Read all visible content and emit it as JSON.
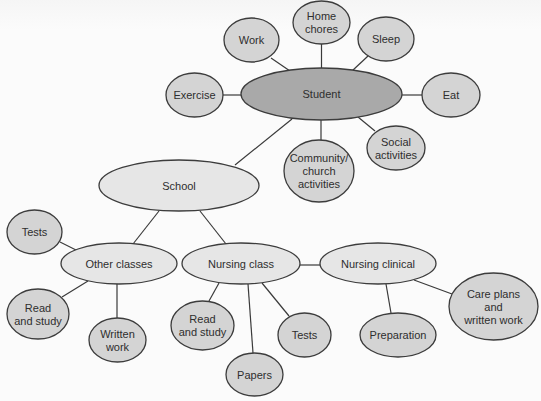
{
  "diagram": {
    "colors": {
      "root_fill": "#a9a9a9",
      "hub_fill": "#e6e6e6",
      "leaf_fill": "#d4d4d4",
      "stroke": "#3c3c3c",
      "text": "#2e2e2e"
    },
    "nodes": [
      {
        "id": "student",
        "lines": [
          "Student"
        ],
        "cx": 321.5,
        "cy": 94,
        "rx": 80.5,
        "ry": 26,
        "kind": "root"
      },
      {
        "id": "work",
        "lines": [
          "Work"
        ],
        "cx": 251.5,
        "cy": 40,
        "rx": 27.5,
        "ry": 22,
        "kind": "leaf"
      },
      {
        "id": "home-chores",
        "lines": [
          "Home",
          "chores"
        ],
        "cx": 321.5,
        "cy": 22.5,
        "rx": 28.5,
        "ry": 21.5,
        "kind": "leaf"
      },
      {
        "id": "sleep",
        "lines": [
          "Sleep"
        ],
        "cx": 386,
        "cy": 39,
        "rx": 28,
        "ry": 22,
        "kind": "leaf"
      },
      {
        "id": "exercise",
        "lines": [
          "Exercise"
        ],
        "cx": 194.5,
        "cy": 95,
        "rx": 28.5,
        "ry": 22,
        "kind": "leaf"
      },
      {
        "id": "eat",
        "lines": [
          "Eat"
        ],
        "cx": 451,
        "cy": 95,
        "rx": 29,
        "ry": 22,
        "kind": "leaf"
      },
      {
        "id": "social-activities",
        "lines": [
          "Social",
          "activities"
        ],
        "cx": 396,
        "cy": 148,
        "rx": 29,
        "ry": 22,
        "kind": "leaf"
      },
      {
        "id": "community-church",
        "lines": [
          "Community/",
          "church",
          "activities"
        ],
        "cx": 319,
        "cy": 171,
        "rx": 35,
        "ry": 31,
        "kind": "leaf"
      },
      {
        "id": "school",
        "lines": [
          "School"
        ],
        "cx": 179,
        "cy": 185.5,
        "rx": 80,
        "ry": 25.5,
        "kind": "hub"
      },
      {
        "id": "other-classes",
        "lines": [
          "Other classes"
        ],
        "cx": 119,
        "cy": 263.5,
        "rx": 58,
        "ry": 20.5,
        "kind": "hub"
      },
      {
        "id": "nursing-class",
        "lines": [
          "Nursing class"
        ],
        "cx": 241,
        "cy": 263.5,
        "rx": 59,
        "ry": 20.5,
        "kind": "hub"
      },
      {
        "id": "nursing-clinical",
        "lines": [
          "Nursing clinical"
        ],
        "cx": 378,
        "cy": 263.5,
        "rx": 58,
        "ry": 20.5,
        "kind": "hub"
      },
      {
        "id": "tests-left",
        "lines": [
          "Tests"
        ],
        "cx": 34.5,
        "cy": 232,
        "rx": 27.5,
        "ry": 22,
        "kind": "leaf"
      },
      {
        "id": "read-study-left",
        "lines": [
          "Read",
          "and study"
        ],
        "cx": 38,
        "cy": 314,
        "rx": 31,
        "ry": 25,
        "kind": "leaf"
      },
      {
        "id": "written-work",
        "lines": [
          "Written",
          "work"
        ],
        "cx": 117.5,
        "cy": 340,
        "rx": 28.5,
        "ry": 22,
        "kind": "leaf"
      },
      {
        "id": "read-study-mid",
        "lines": [
          "Read",
          "and study"
        ],
        "cx": 202.5,
        "cy": 325.5,
        "rx": 31.5,
        "ry": 24.5,
        "kind": "leaf"
      },
      {
        "id": "papers",
        "lines": [
          "Papers"
        ],
        "cx": 254.5,
        "cy": 374.5,
        "rx": 28.5,
        "ry": 21.5,
        "kind": "leaf"
      },
      {
        "id": "tests-mid",
        "lines": [
          "Tests"
        ],
        "cx": 304.5,
        "cy": 335,
        "rx": 26.5,
        "ry": 22,
        "kind": "leaf"
      },
      {
        "id": "preparation",
        "lines": [
          "Preparation"
        ],
        "cx": 398,
        "cy": 335,
        "rx": 38,
        "ry": 22,
        "kind": "leaf"
      },
      {
        "id": "care-plans",
        "lines": [
          "Care plans",
          "and",
          "written work"
        ],
        "cx": 493.5,
        "cy": 306.5,
        "rx": 44.5,
        "ry": 33.5,
        "kind": "leaf"
      }
    ],
    "edges": [
      {
        "from": "student",
        "to": "work",
        "x1": 290,
        "y1": 71,
        "x2": 271,
        "y2": 58
      },
      {
        "from": "student",
        "to": "home-chores",
        "x1": 321.5,
        "y1": 68,
        "x2": 321.5,
        "y2": 44
      },
      {
        "from": "student",
        "to": "sleep",
        "x1": 352,
        "y1": 71,
        "x2": 368,
        "y2": 56
      },
      {
        "from": "student",
        "to": "exercise",
        "x1": 241,
        "y1": 95,
        "x2": 223,
        "y2": 95
      },
      {
        "from": "student",
        "to": "eat",
        "x1": 402,
        "y1": 95,
        "x2": 422,
        "y2": 95
      },
      {
        "from": "student",
        "to": "social-activities",
        "x1": 358,
        "y1": 117,
        "x2": 375,
        "y2": 131
      },
      {
        "from": "student",
        "to": "community-church",
        "x1": 321,
        "y1": 120,
        "x2": 321,
        "y2": 140
      },
      {
        "from": "student",
        "to": "school",
        "x1": 292,
        "y1": 119,
        "x2": 235,
        "y2": 165
      },
      {
        "from": "school",
        "to": "other-classes",
        "x1": 159,
        "y1": 211,
        "x2": 133,
        "y2": 244
      },
      {
        "from": "school",
        "to": "nursing-class",
        "x1": 200,
        "y1": 211,
        "x2": 226,
        "y2": 244
      },
      {
        "from": "other-classes",
        "to": "tests-left",
        "x1": 76,
        "y1": 250,
        "x2": 60,
        "y2": 242
      },
      {
        "from": "other-classes",
        "to": "read-study-left",
        "x1": 88,
        "y1": 281,
        "x2": 62,
        "y2": 297
      },
      {
        "from": "other-classes",
        "to": "written-work",
        "x1": 117,
        "y1": 284,
        "x2": 117,
        "y2": 318
      },
      {
        "from": "nursing-class",
        "to": "nursing-clinical",
        "x1": 300,
        "y1": 265,
        "x2": 320,
        "y2": 265
      },
      {
        "from": "nursing-class",
        "to": "read-study-mid",
        "x1": 219,
        "y1": 283,
        "x2": 209,
        "y2": 301
      },
      {
        "from": "nursing-class",
        "to": "papers",
        "x1": 248,
        "y1": 284,
        "x2": 253,
        "y2": 353
      },
      {
        "from": "nursing-class",
        "to": "tests-mid",
        "x1": 262,
        "y1": 283,
        "x2": 289,
        "y2": 316
      },
      {
        "from": "nursing-clinical",
        "to": "preparation",
        "x1": 386,
        "y1": 284,
        "x2": 391,
        "y2": 313
      },
      {
        "from": "nursing-clinical",
        "to": "care-plans",
        "x1": 414,
        "y1": 280,
        "x2": 452,
        "y2": 294
      }
    ]
  }
}
